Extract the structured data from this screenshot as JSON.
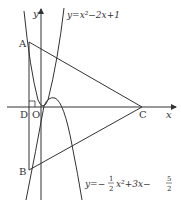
{
  "diagram": {
    "axes": {
      "x_label": "x",
      "y_label": "y",
      "origin_label": "O"
    },
    "points": {
      "A": "A",
      "B": "B",
      "C": "C",
      "D": "D"
    },
    "curves": [
      {
        "name": "parabola-1",
        "equation": "y=x²−2x+1"
      },
      {
        "name": "parabola-2",
        "equation_prefix": "y=−",
        "fraction1": {
          "num": "1",
          "den": "2"
        },
        "equation_mid": "x²+3x−",
        "fraction2": {
          "num": "5",
          "den": "2"
        }
      }
    ],
    "right_angle_marker_at": "D",
    "colors": {
      "stroke": "#333333",
      "background": "#ffffff"
    }
  }
}
